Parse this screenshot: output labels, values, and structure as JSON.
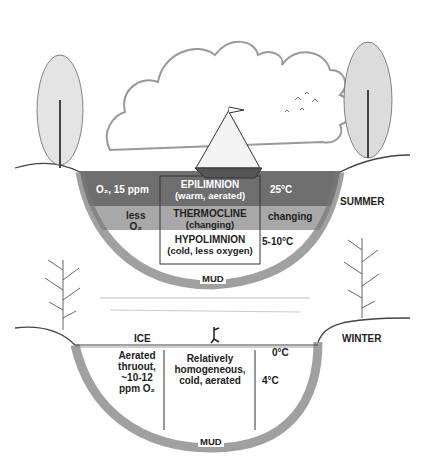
{
  "summer": {
    "season_label": "SUMMER",
    "layers": [
      {
        "name": "EPILIMNION",
        "desc": "(warm, aerated)",
        "left": "O₂, 15 ppm",
        "right": "25°C",
        "color": "#6e6e6e"
      },
      {
        "name": "THERMOCLINE",
        "desc": "(changing)",
        "left_line1": "less",
        "left_line2": "O₂",
        "right": "changing",
        "color": "#a8a8a8"
      },
      {
        "name": "HYPOLIMNION",
        "desc": "(cold, less oxygen)",
        "right": "5-10°C",
        "color": "#ffffff"
      }
    ],
    "bottom": "MUD"
  },
  "winter": {
    "season_label": "WINTER",
    "ice_label": "ICE",
    "surface_temp": "0°C",
    "left_text": [
      "Aerated",
      "thruout,",
      "~10-12",
      "ppm O₂"
    ],
    "center_text": [
      "Relatively",
      "homogeneous,",
      "cold, aerated"
    ],
    "right_temp": "4°C",
    "bottom": "MUD"
  }
}
